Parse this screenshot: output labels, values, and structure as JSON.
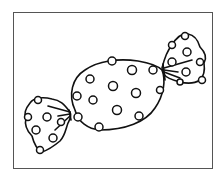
{
  "illustration": {
    "subject": "wrapped candy with polka dots",
    "style": "black line art on white",
    "colors": {
      "stroke": "#111111",
      "frame": "#555555",
      "background": "#ffffff"
    }
  }
}
